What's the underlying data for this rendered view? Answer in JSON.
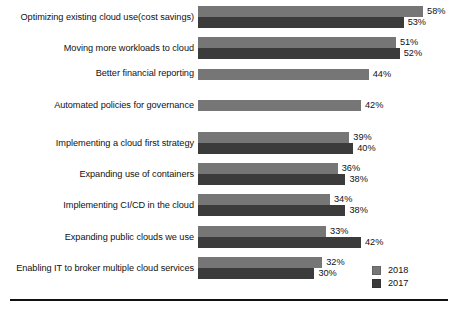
{
  "chart_data": {
    "type": "bar",
    "orientation": "horizontal",
    "title": "",
    "xlabel": "",
    "ylabel": "",
    "xlim": [
      0,
      60
    ],
    "grid": false,
    "legend_position": "bottom-right",
    "value_suffix": "%",
    "categories": [
      "Optimizing existing cloud use(cost savings)",
      "Moving more workloads to cloud",
      "Better financial reporting",
      "Automated policies for governance",
      "Implementing a cloud first strategy",
      "Expanding use of containers",
      "Implementing CI/CD in the cloud",
      "Expanding public clouds we use",
      "Enabling IT to broker multiple cloud services"
    ],
    "series": [
      {
        "name": "2018",
        "color": "#767676",
        "values": [
          58,
          51,
          44,
          42,
          39,
          36,
          34,
          33,
          32
        ],
        "labels": [
          "58%",
          "51%",
          "44%",
          "42%",
          "39%",
          "36%",
          "34%",
          "33%",
          "32%"
        ]
      },
      {
        "name": "2017",
        "color": "#3b3b3b",
        "values": [
          53,
          52,
          null,
          null,
          40,
          38,
          38,
          42,
          30
        ],
        "labels": [
          "53%",
          "52%",
          null,
          null,
          "40%",
          "38%",
          "38%",
          "42%",
          "30%"
        ]
      }
    ]
  },
  "legend": {
    "items": [
      {
        "label": "2018",
        "color": "#767676"
      },
      {
        "label": "2017",
        "color": "#3b3b3b"
      }
    ]
  }
}
